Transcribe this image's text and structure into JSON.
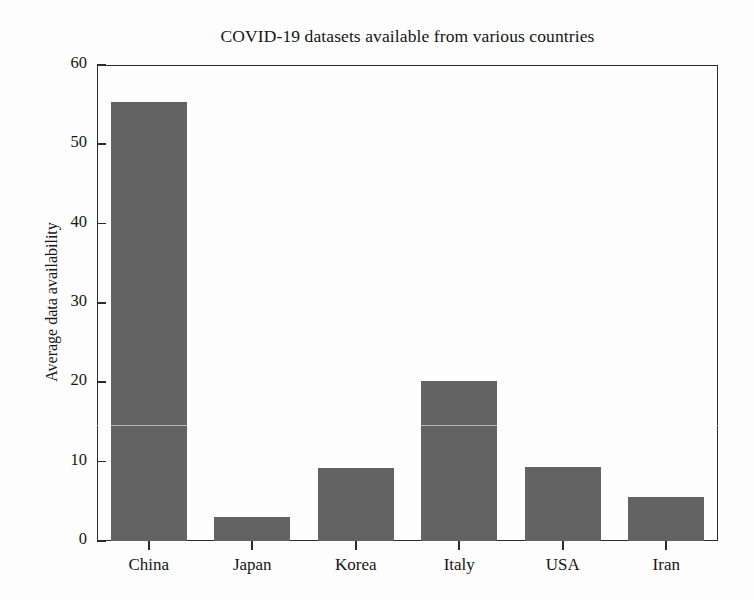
{
  "chart_data": {
    "type": "bar",
    "title": "COVID-19 datasets available from various countries",
    "xlabel": "",
    "ylabel": "Average data availability",
    "categories": [
      "China",
      "Japan",
      "Korea",
      "Italy",
      "USA",
      "Iran"
    ],
    "values": [
      55.3,
      3.0,
      9.2,
      20.2,
      9.3,
      5.5
    ],
    "ylim": [
      0,
      60
    ],
    "yticks": [
      0,
      10,
      20,
      30,
      40,
      50,
      60
    ],
    "ytick_labels": [
      "0",
      "10",
      "20",
      "30",
      "40",
      "50",
      "60"
    ],
    "grid": false,
    "legend": null,
    "bar_color": "#636363",
    "axis_color": "#2b2b2b",
    "background_color": "#fdfdfd"
  }
}
